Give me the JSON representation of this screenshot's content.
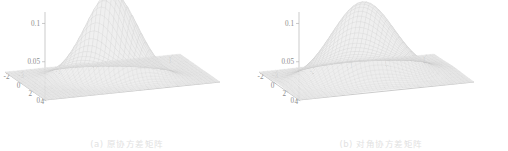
{
  "figure": {
    "background": "#ffffff",
    "panels": [
      {
        "id": "panel-a",
        "caption": "(a) 原协方差矩阵",
        "chart_ref": 0
      },
      {
        "id": "panel-b",
        "caption": "(b) 对角协方差矩阵",
        "chart_ref": 1
      }
    ]
  },
  "chart_data": [
    {
      "type": "surface",
      "title": "",
      "caption": "(a) 原协方差矩阵",
      "xlabel": "",
      "ylabel": "",
      "zlabel": "",
      "x_ticks": [
        "-3",
        "-2",
        "-1",
        "0",
        "1"
      ],
      "x_tick_values": [
        -3,
        -2,
        -1,
        0,
        1
      ],
      "y_ticks": [
        "4",
        "2",
        "0",
        "-2"
      ],
      "y_tick_values": [
        4,
        2,
        0,
        -2
      ],
      "z_ticks": [
        "0",
        "0.05",
        "0.1"
      ],
      "z_tick_values": [
        0,
        0.05,
        0.1
      ],
      "xlim": [
        -3.5,
        1.2
      ],
      "ylim": [
        -2.5,
        4.2
      ],
      "zlim": [
        0,
        0.115
      ],
      "peak_value": 0.112,
      "peak_x": -1.2,
      "peak_y": 1.0,
      "sigma_x": 0.62,
      "sigma_y": 0.95,
      "correlation": 0.45,
      "grid": false,
      "legend": "none",
      "surface_color_light": "#fcfcfc",
      "surface_color_dark": "#a6a6a6",
      "mesh_color": "#bdbdbd"
    },
    {
      "type": "surface",
      "title": "",
      "caption": "(b) 对角协方差矩阵",
      "xlabel": "",
      "ylabel": "",
      "zlabel": "",
      "x_ticks": [
        "-3",
        "-2",
        "-1",
        "0",
        "1"
      ],
      "x_tick_values": [
        -3,
        -2,
        -1,
        0,
        1
      ],
      "y_ticks": [
        "4",
        "2",
        "0",
        "-2"
      ],
      "y_tick_values": [
        4,
        2,
        0,
        -2
      ],
      "z_ticks": [
        "0",
        "0.05",
        "0.1"
      ],
      "z_tick_values": [
        0,
        0.05,
        0.1
      ],
      "xlim": [
        -3.5,
        1.2
      ],
      "ylim": [
        -2.5,
        4.2
      ],
      "zlim": [
        0,
        0.115
      ],
      "peak_value": 0.099,
      "peak_x": -1.25,
      "peak_y": 0.9,
      "sigma_x": 0.82,
      "sigma_y": 1.15,
      "correlation": 0.0,
      "grid": false,
      "legend": "none",
      "surface_color_light": "#fcfcfc",
      "surface_color_dark": "#a6a6a6",
      "mesh_color": "#bdbdbd"
    }
  ],
  "axis_style": {
    "axis_line_color": "#b4b4b4",
    "tick_label_color": "#8d8d8d",
    "caption_color": "#e2e2e2"
  }
}
